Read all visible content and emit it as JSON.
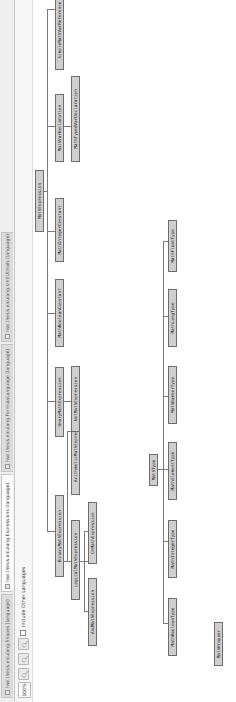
{
  "tabs": [
    {
      "label": "hse.thesis.eiculang.Shapes (language)",
      "active": false,
      "icon": "language-icon"
    },
    {
      "label": "hse.thesis.eiculang.Expressions (language)",
      "active": true,
      "icon": "language-icon"
    },
    {
      "label": "hse.thesis.eiculang.FormulaLanguage (language)",
      "active": false,
      "icon": "language-icon"
    },
    {
      "label": "hse.thesis.eiculang.smtlUtmals (language)",
      "active": false,
      "icon": "language-icon"
    }
  ],
  "toolbar": {
    "zoom_level": "100%",
    "zoom_in_icon": "zoom-in-icon",
    "zoom_out_icon": "zoom-out-icon",
    "zoom_fit_icon": "zoom-fit-icon",
    "include_other_languages_label": "Include Other Languages",
    "include_other_languages_checked": false
  },
  "diagram": {
    "colors": {
      "node_fill": "#cfcfcf",
      "node_border": "#6e6e6e",
      "edge": "#7a7a7a"
    },
    "nodes": {
      "math_expression": "MathExpression",
      "binary_math_expression": "BinaryMathExpression",
      "logical_math_expression": "LogicalMathExpression",
      "and_math_expression": "AndMathExpression",
      "or_math_expression": "OrMathExpression",
      "arithmetic_math_expression": "ArithmeticMathExpression",
      "unary_math_expression": "UnaryMathExpression",
      "not_math_expression": "NotMathExpression",
      "math_boolean_constant": "MathBooleanConstant",
      "math_integer_constant": "MathIntegerConstant",
      "math_var_declaration": "MathVarDeclaration",
      "math_typed_var_declaration": "MathTypedVarDeclaration",
      "simple_math_var_reference": "SimpleMathVarReference",
      "math_type": "MathType",
      "math_boolean_type": "MathBooleanType",
      "math_integer_type": "MathIntegerType",
      "math_element_type": "MathElementType",
      "math_number_type": "MathNumberType",
      "math_long_type": "MathLongType",
      "math_float_type": "MathFloatType",
      "math_wrapper": "MathWrapper"
    }
  }
}
